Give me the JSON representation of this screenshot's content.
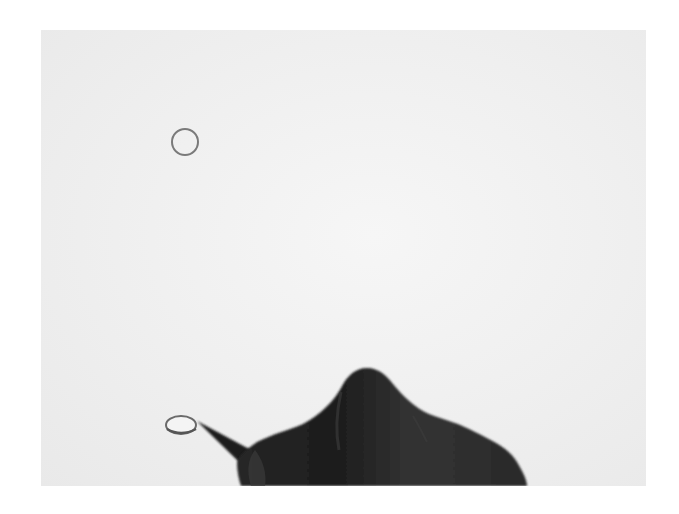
{
  "image": {
    "description": "Photograph of a hand holding a pencil drawing a small ellipse on white paper, with an outlined circle above",
    "background_color": "#ffffff",
    "paper_color": "#efefef",
    "elements": {
      "outlined_circle": {
        "cx": 144,
        "cy": 112,
        "r": 13,
        "stroke": "#7a7a7a"
      },
      "drawn_ellipse": {
        "cx": 140,
        "cy": 396,
        "rx": 15,
        "ry": 9,
        "stroke": "#6a6a6a"
      },
      "pencil": {
        "color": "#1e1e1e"
      },
      "hand": {
        "color": "#2e2e2e",
        "shadow_color": "#1c1c1c"
      }
    }
  }
}
